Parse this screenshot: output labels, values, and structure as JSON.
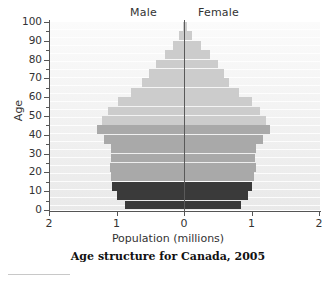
{
  "chart_title": "Age structure for Canada,  2005",
  "axes": {
    "x_title": "Population (millions)",
    "y_title": "Age",
    "x_ticks": [
      "2",
      "1",
      "0",
      "1",
      "2"
    ],
    "y_ticks": [
      "0",
      "10",
      "20",
      "30",
      "40",
      "50",
      "60",
      "70",
      "80",
      "90",
      "100"
    ]
  },
  "legend": {
    "male": "Male",
    "female": "Female"
  },
  "colors": {
    "pre_reproductive": "#3a3a3a",
    "reproductive": "#a9a9a9",
    "post_reproductive": "#cccccc",
    "plot_background": "#f2f2f2",
    "axis": "#555555",
    "center_line": "#5a5a5a",
    "text": "#333333"
  },
  "chart_data": {
    "type": "bar",
    "subtype": "population-pyramid",
    "title": "Age structure for Canada,  2005",
    "xlabel": "Population (millions)",
    "ylabel": "Age",
    "xlim": [
      -2,
      2
    ],
    "ylim": [
      0,
      100
    ],
    "x_tick_values": [
      -2,
      -1,
      0,
      1,
      2
    ],
    "x_tick_labels": [
      "2",
      "1",
      "0",
      "1",
      "2"
    ],
    "y_tick_values": [
      0,
      10,
      20,
      30,
      40,
      50,
      60,
      70,
      80,
      90,
      100
    ],
    "grid": true,
    "legend_position": "top",
    "units": "millions",
    "bin_width_years": 5,
    "categories": [
      "0-4",
      "5-9",
      "10-14",
      "15-19",
      "20-24",
      "25-29",
      "30-34",
      "35-39",
      "40-44",
      "45-49",
      "50-54",
      "55-59",
      "60-64",
      "65-69",
      "70-74",
      "75-79",
      "80-84",
      "85-89",
      "90-94",
      "95-99",
      "100+"
    ],
    "series": [
      {
        "name": "Male",
        "direction": "left",
        "color_groups": [
          "pre",
          "pre",
          "pre",
          "rep",
          "rep",
          "rep",
          "rep",
          "rep",
          "rep",
          "post",
          "post",
          "post",
          "post",
          "post",
          "post",
          "post",
          "post",
          "post",
          "post",
          "post",
          "post"
        ],
        "values": [
          0.88,
          1.0,
          1.07,
          1.08,
          1.1,
          1.08,
          1.08,
          1.18,
          1.29,
          1.22,
          1.12,
          0.98,
          0.78,
          0.62,
          0.52,
          0.41,
          0.28,
          0.16,
          0.07,
          0.02,
          0.01
        ]
      },
      {
        "name": "Female",
        "direction": "right",
        "color_groups": [
          "pre",
          "pre",
          "pre",
          "rep",
          "rep",
          "rep",
          "rep",
          "rep",
          "rep",
          "post",
          "post",
          "post",
          "post",
          "post",
          "post",
          "post",
          "post",
          "post",
          "post",
          "post",
          "post"
        ],
        "values": [
          0.84,
          0.95,
          1.01,
          1.03,
          1.06,
          1.05,
          1.07,
          1.17,
          1.28,
          1.22,
          1.13,
          1.0,
          0.82,
          0.67,
          0.59,
          0.5,
          0.38,
          0.25,
          0.12,
          0.04,
          0.01
        ]
      }
    ]
  }
}
